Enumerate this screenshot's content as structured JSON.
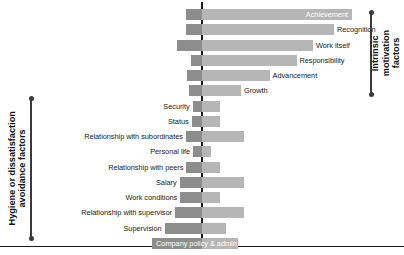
{
  "chart_data": {
    "type": "bar",
    "title": "",
    "subtitle": "",
    "xlabel": "",
    "ylabel": "",
    "orientation": "horizontal",
    "style": "diverging-bar",
    "grid": false,
    "legend_position": "none",
    "xlim": [
      -100,
      100
    ],
    "zero_axis": 0,
    "axis_colors": {
      "dissatisfaction_bar": "#8d8d8d",
      "satisfaction_bar": "#b6b6b6",
      "axis_line": "#1b1b1b",
      "bracket": "#3a3a3a"
    },
    "series": [
      {
        "name": "Factors leading to dissatisfaction",
        "side": "left",
        "color": "#8d8d8d"
      },
      {
        "name": "Factors leading to satisfaction",
        "side": "right",
        "color": "#b6b6b6"
      }
    ],
    "categories": [
      "Achievement",
      "Recognition",
      "Work itself",
      "Responsibility",
      "Advancement",
      "Growth",
      "Security",
      "Status",
      "Relationship with subordinates",
      "Personal life",
      "Relationship with peers",
      "Salary",
      "Work conditions",
      "Relationship with supervisor",
      "Supervision",
      "Company policy & admin."
    ],
    "points": [
      {
        "label": "Achievement",
        "group": "intrinsic",
        "dissatisfaction": 31,
        "satisfaction": 100,
        "label_position": "inside-right",
        "label_color": "#ffffff"
      },
      {
        "label": "Recognition",
        "group": "intrinsic",
        "dissatisfaction": 31,
        "satisfaction": 88,
        "label_position": "outside-right",
        "label_color": "#1b1b1b"
      },
      {
        "label": "Work itself",
        "group": "intrinsic",
        "dissatisfaction": 48,
        "satisfaction": 74,
        "label_position": "outside-right",
        "label_color": "#1b1b1b"
      },
      {
        "label": "Responsibility",
        "group": "intrinsic",
        "dissatisfaction": 22,
        "satisfaction": 63,
        "label_position": "outside-right",
        "label_color": "#1b1b1b"
      },
      {
        "label": "Advancement",
        "group": "intrinsic",
        "dissatisfaction": 28,
        "satisfaction": 45,
        "label_position": "outside-right",
        "label_color": "#1b1b1b"
      },
      {
        "label": "Growth",
        "group": "intrinsic",
        "dissatisfaction": 25,
        "satisfaction": 26,
        "label_position": "outside-right",
        "label_color": "#1b1b1b"
      },
      {
        "label": "Security",
        "group": "hygiene",
        "dissatisfaction": 18,
        "satisfaction": 12,
        "label_position": "outside-left",
        "label_color": "#1b1b1b"
      },
      {
        "label": "Status",
        "group": "hygiene",
        "dissatisfaction": 20,
        "satisfaction": 12,
        "label_position": "outside-left",
        "label_color": "#1b1b1b"
      },
      {
        "label": "Relationship with subordinates",
        "group": "hygiene",
        "dissatisfaction": 31,
        "satisfaction": 28,
        "label_position": "outside-left",
        "label_color": "#1b1b1b"
      },
      {
        "label": "Personal life",
        "group": "hygiene",
        "dissatisfaction": 17,
        "satisfaction": 6,
        "label_position": "outside-left",
        "label_color": "#1b1b1b"
      },
      {
        "label": "Relationship with peers",
        "group": "hygiene",
        "dissatisfaction": 30,
        "satisfaction": 12,
        "label_position": "outside-left",
        "label_color": "#1b1b1b"
      },
      {
        "label": "Salary",
        "group": "hygiene",
        "dissatisfaction": 43,
        "satisfaction": 28,
        "label_position": "outside-left",
        "label_color": "#1b1b1b"
      },
      {
        "label": "Work conditions",
        "group": "hygiene",
        "dissatisfaction": 42,
        "satisfaction": 12,
        "label_position": "outside-left",
        "label_color": "#1b1b1b"
      },
      {
        "label": "Relationship with supervisor",
        "group": "hygiene",
        "dissatisfaction": 52,
        "satisfaction": 28,
        "label_position": "outside-left",
        "label_color": "#1b1b1b"
      },
      {
        "label": "Supervision",
        "group": "hygiene",
        "dissatisfaction": 72,
        "satisfaction": 16,
        "label_position": "outside-left",
        "label_color": "#1b1b1b"
      },
      {
        "label": "Company policy & admin.",
        "group": "hygiene",
        "dissatisfaction": 96,
        "satisfaction": 24,
        "label_position": "inside-left",
        "label_color": "#ffffff"
      }
    ],
    "annotations": [
      {
        "id": "intrinsic-bracket",
        "text": "Intrinsic motivation\nfactors",
        "side": "right",
        "covers": [
          "Achievement",
          "Growth"
        ]
      },
      {
        "id": "hygiene-bracket",
        "text": "Hygiene or dissatisfaction\navoidance factors",
        "side": "left",
        "covers": [
          "Security",
          "Company policy & admin."
        ]
      }
    ]
  },
  "brackets": {
    "intrinsic": {
      "label": "Intrinsic motivation\nfactors"
    },
    "hygiene": {
      "label": "Hygiene or dissatisfaction\navoidance factors"
    }
  }
}
